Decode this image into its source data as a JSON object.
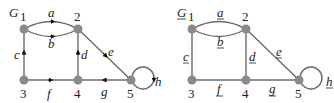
{
  "graphs": [
    {
      "title": "G",
      "directed": true,
      "nodes": [
        {
          "id": "1",
          "label": "1"
        },
        {
          "id": "2",
          "label": "2"
        },
        {
          "id": "3",
          "label": "3"
        },
        {
          "id": "4",
          "label": "4"
        },
        {
          "id": "5",
          "label": "5"
        }
      ],
      "edges": [
        {
          "label": "a",
          "from": "1",
          "to": "2"
        },
        {
          "label": "b",
          "from": "1",
          "to": "2"
        },
        {
          "label": "c",
          "from": "3",
          "to": "1"
        },
        {
          "label": "d",
          "from": "4",
          "to": "2"
        },
        {
          "label": "e",
          "from": "2",
          "to": "5"
        },
        {
          "label": "f",
          "from": "3",
          "to": "4"
        },
        {
          "label": "g",
          "from": "5",
          "to": "4"
        },
        {
          "label": "h",
          "from": "5",
          "to": "5"
        }
      ]
    },
    {
      "title": "G",
      "directed": false,
      "underlined_labels": true,
      "nodes": [
        {
          "id": "1",
          "label": "1"
        },
        {
          "id": "2",
          "label": "2"
        },
        {
          "id": "3",
          "label": "3"
        },
        {
          "id": "4",
          "label": "4"
        },
        {
          "id": "5",
          "label": "5"
        }
      ],
      "edges": [
        {
          "label": "a",
          "ends": [
            "1",
            "2"
          ]
        },
        {
          "label": "b",
          "ends": [
            "1",
            "2"
          ]
        },
        {
          "label": "c",
          "ends": [
            "1",
            "3"
          ]
        },
        {
          "label": "d",
          "ends": [
            "2",
            "4"
          ]
        },
        {
          "label": "e",
          "ends": [
            "2",
            "5"
          ]
        },
        {
          "label": "f",
          "ends": [
            "3",
            "4"
          ]
        },
        {
          "label": "g",
          "ends": [
            "4",
            "5"
          ]
        },
        {
          "label": "h",
          "ends": [
            "5",
            "5"
          ]
        }
      ]
    }
  ]
}
